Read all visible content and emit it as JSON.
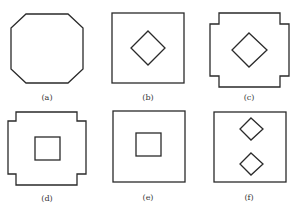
{
  "figure": {
    "panels": [
      {
        "id": "a",
        "label": "(a)",
        "description": "octagon"
      },
      {
        "id": "b",
        "label": "(b)",
        "description": "square with inner diamond"
      },
      {
        "id": "c",
        "label": "(c)",
        "description": "notched-corner square with inner diamond"
      },
      {
        "id": "d",
        "label": "(d)",
        "description": "notched-corner square with inner square"
      },
      {
        "id": "e",
        "label": "(e)",
        "description": "square with inner square"
      },
      {
        "id": "f",
        "label": "(f)",
        "description": "square with two inner diamonds"
      }
    ],
    "colors": {
      "stroke": "#2a2a2a",
      "background": "#ffffff",
      "label": "#333333"
    }
  }
}
